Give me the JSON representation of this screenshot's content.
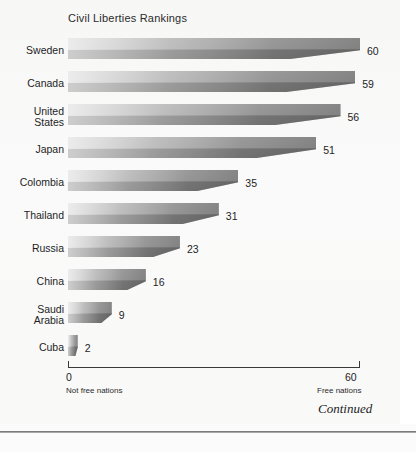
{
  "chart_data": {
    "type": "bar",
    "orientation": "horizontal",
    "title": "Civil Liberties Rankings",
    "categories": [
      "Sweden",
      "Canada",
      "United\nStates",
      "Japan",
      "Colombia",
      "Thailand",
      "Russia",
      "China",
      "Saudi\nArabia",
      "Cuba"
    ],
    "values": [
      60,
      59,
      56,
      51,
      35,
      31,
      23,
      16,
      9,
      2
    ],
    "xlabel": "",
    "ylabel": "",
    "xlim": [
      0,
      60
    ],
    "axis_ticks": [
      "0",
      "60"
    ],
    "axis_tick_captions": [
      "Not free nations",
      "Free nations"
    ],
    "grid": false,
    "legend": false,
    "data_labels": [
      "60",
      "59",
      "56",
      "51",
      "35",
      "31",
      "23",
      "16",
      "9",
      "2"
    ]
  },
  "footer": {
    "continued_label": "Continued"
  },
  "colors": {
    "bar_light": "#e6e6e6",
    "bar_dark": "#9d9d9d",
    "axis": "#3b3b3b",
    "text": "#1e1e1e",
    "page_background": "#f9f9f8"
  }
}
